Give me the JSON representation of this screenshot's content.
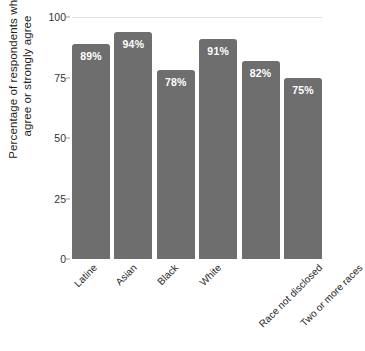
{
  "chart_data": {
    "type": "bar",
    "title": "",
    "subtitle": "",
    "xlabel": "",
    "ylabel": "Percentage of respondents who agree or strongly agree",
    "ylabel_lines": [
      "Percentage of respondents who",
      "agree or strongly agree"
    ],
    "categories": [
      "Latine",
      "Asian",
      "Black",
      "White",
      "Race not disclosed",
      "Two or more races"
    ],
    "values": [
      89,
      94,
      78,
      91,
      82,
      75
    ],
    "value_labels": [
      "89%",
      "94%",
      "78%",
      "91%",
      "82%",
      "75%"
    ],
    "ylim": [
      0,
      100
    ],
    "yticks": [
      0,
      25,
      50,
      75,
      100
    ],
    "ytick_labels": [
      "0",
      "25",
      "50",
      "75",
      "100"
    ],
    "grid": "top-only",
    "legend": "none",
    "bar_color": "#6e6e6e",
    "value_label_color": "#ffffff",
    "gridline_color": "#e3e3e3",
    "background_color": "#ffffff"
  }
}
